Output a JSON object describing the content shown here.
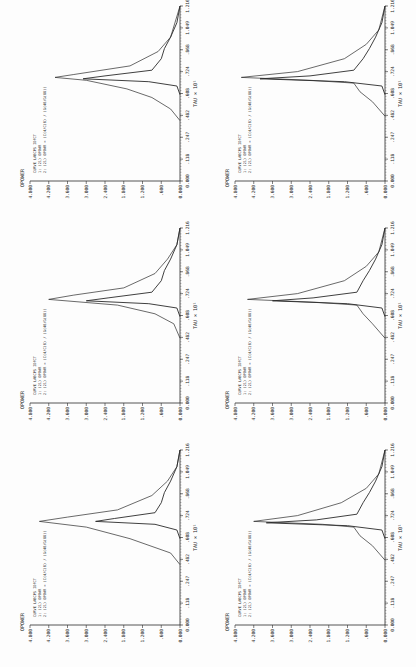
{
  "chart_data": [
    {
      "type": "line",
      "panel": 1,
      "ylabel": "OPOWER",
      "xlabel": "TAU × 10^1",
      "yticks": [
        "0.000",
        ".600",
        "1.200",
        "1.800",
        "2.400",
        "3.000",
        "3.600",
        "4.200",
        "4.800"
      ],
      "xticks": [
        "0.000",
        ".118",
        ".247",
        ".482",
        ".608",
        ".724",
        ".868",
        "1.049",
        "1.216"
      ],
      "ylim": [
        0,
        4.8
      ],
      "xlim": [
        0,
        1.216
      ],
      "legend": {
        "headers": [
          "CURVE",
          "LABCPS",
          "IDFCT"
        ],
        "rows": [
          [
            "1:",
            "(21)",
            "OPOWR"
          ],
          [
            "2:",
            "(21)",
            "OPOWR = (C(4/C(8) / (G(48/G(88))"
          ]
        ]
      },
      "series": [
        {
          "name": "1",
          "x": [
            0.42,
            0.5,
            0.6,
            0.68,
            0.72,
            0.75,
            0.8,
            0.9,
            1.0,
            1.1,
            1.216
          ],
          "y": [
            0.0,
            0.3,
            1.6,
            3.0,
            4.5,
            3.6,
            2.0,
            0.9,
            0.4,
            0.1,
            0.0
          ]
        },
        {
          "name": "2",
          "x": [
            0.6,
            0.66,
            0.7,
            0.72,
            0.74,
            0.78,
            0.85,
            0.92,
            1.0,
            1.1,
            1.216
          ],
          "y": [
            0.0,
            0.1,
            0.8,
            2.7,
            2.1,
            0.8,
            0.6,
            0.5,
            0.3,
            0.1,
            0.0
          ]
        }
      ]
    },
    {
      "type": "line",
      "panel": 2,
      "ylabel": "OPOWER",
      "xlabel": "TAU × 10^1",
      "yticks": [
        "0.000",
        ".600",
        "1.200",
        "1.800",
        "2.400",
        "3.000",
        "3.600",
        "4.200",
        "4.800"
      ],
      "xticks": [
        "0.000",
        ".118",
        ".247",
        ".482",
        ".608",
        ".724",
        ".868",
        "1.049",
        "1.216"
      ],
      "ylim": [
        0,
        4.8
      ],
      "xlim": [
        0,
        1.216
      ],
      "legend": {
        "headers": [
          "CURVE",
          "LABCPS",
          "IDFCT"
        ],
        "rows": [
          [
            "1:",
            "(21)",
            "OPOWR"
          ],
          [
            "2:",
            "(21)",
            "OPOWR = (C(4/C(8) / (G(48/G(88))"
          ]
        ]
      },
      "series": [
        {
          "name": "1",
          "x": [
            0.45,
            0.55,
            0.62,
            0.68,
            0.72,
            0.75,
            0.8,
            0.9,
            1.0,
            1.1,
            1.216
          ],
          "y": [
            0.0,
            0.2,
            0.8,
            2.0,
            4.2,
            3.4,
            1.8,
            0.8,
            0.4,
            0.1,
            0.0
          ]
        },
        {
          "name": "2",
          "x": [
            0.6,
            0.66,
            0.69,
            0.71,
            0.73,
            0.77,
            0.85,
            0.92,
            1.0,
            1.1,
            1.216
          ],
          "y": [
            0.0,
            0.1,
            1.0,
            3.0,
            2.3,
            0.9,
            0.6,
            0.5,
            0.3,
            0.1,
            0.0
          ]
        }
      ]
    },
    {
      "type": "line",
      "panel": 3,
      "ylabel": "OPOWER",
      "xlabel": "TAU × 10^1",
      "yticks": [
        "0.000",
        ".600",
        "1.200",
        "1.800",
        "2.400",
        "3.000",
        "3.600",
        "4.200",
        "4.800"
      ],
      "xticks": [
        "0.000",
        ".118",
        ".247",
        ".482",
        ".608",
        ".724",
        ".868",
        "1.049",
        "1.216"
      ],
      "ylim": [
        0,
        4.8
      ],
      "xlim": [
        0,
        1.216
      ],
      "legend": {
        "headers": [
          "CURVE",
          "LABCPS",
          "IDFCT"
        ],
        "rows": [
          [
            "1:",
            "(21)",
            "OPOWR"
          ],
          [
            "2:",
            "(21)",
            "OPOWR = (C(4/C(8) / (G(48/G(88))"
          ]
        ]
      },
      "series": [
        {
          "name": "1",
          "x": [
            0.42,
            0.5,
            0.58,
            0.64,
            0.7,
            0.72,
            0.74,
            0.8,
            0.9,
            1.0,
            1.216
          ],
          "y": [
            0.0,
            0.3,
            0.9,
            1.7,
            3.0,
            4.0,
            3.4,
            1.6,
            0.7,
            0.3,
            0.0
          ]
        },
        {
          "name": "2",
          "x": [
            0.6,
            0.66,
            0.69,
            0.71,
            0.73,
            0.77,
            0.85,
            0.92,
            1.0,
            1.1,
            1.216
          ],
          "y": [
            0.0,
            0.1,
            1.0,
            3.1,
            2.4,
            0.9,
            0.6,
            0.5,
            0.3,
            0.1,
            0.0
          ]
        }
      ]
    },
    {
      "type": "line",
      "panel": 4,
      "ylabel": "OPOWER",
      "xlabel": "TAU × 10^1",
      "yticks": [
        "0.000",
        ".600",
        "1.200",
        "1.800",
        "2.400",
        "3.000",
        "3.600",
        "4.200",
        "4.800"
      ],
      "xticks": [
        "0.000",
        ".118",
        ".247",
        ".482",
        ".608",
        ".724",
        ".868",
        "1.049",
        "1.216"
      ],
      "ylim": [
        0,
        4.8
      ],
      "xlim": [
        0,
        1.216
      ],
      "legend": {
        "headers": [
          "CURVE",
          "LABCPS",
          "IDFCT"
        ],
        "rows": [
          [
            "1:",
            "(21)",
            "OPOWR"
          ],
          [
            "2:",
            "(21)",
            "OPOWR = (C(4/C(8) / (G(48/G(88))"
          ]
        ]
      },
      "series": [
        {
          "name": "1",
          "x": [
            0.45,
            0.55,
            0.62,
            0.68,
            0.7,
            0.72,
            0.76,
            0.85,
            0.95,
            1.05,
            1.216
          ],
          "y": [
            0.0,
            0.4,
            0.8,
            1.0,
            2.0,
            4.2,
            2.8,
            1.4,
            0.6,
            0.2,
            0.0
          ]
        },
        {
          "name": "2",
          "x": [
            0.6,
            0.66,
            0.69,
            0.71,
            0.73,
            0.77,
            0.85,
            0.92,
            1.0,
            1.1,
            1.216
          ],
          "y": [
            0.0,
            0.1,
            1.2,
            3.8,
            2.2,
            0.9,
            0.7,
            0.5,
            0.3,
            0.1,
            0.0
          ]
        }
      ]
    },
    {
      "type": "line",
      "panel": 5,
      "ylabel": "OPOWER",
      "xlabel": "TAU × 10^1",
      "yticks": [
        "0.000",
        ".600",
        "1.200",
        "1.800",
        "2.400",
        "3.000",
        "3.600",
        "4.200",
        "4.800"
      ],
      "xticks": [
        "0.000",
        ".118",
        ".247",
        ".482",
        ".608",
        ".724",
        ".868",
        "1.049",
        "1.216"
      ],
      "ylim": [
        0,
        4.8
      ],
      "xlim": [
        0,
        1.216
      ],
      "legend": {
        "headers": [
          "CURVE",
          "LABCPS",
          "IDFCT"
        ],
        "rows": [
          [
            "1:",
            "(21)",
            "OPOWR"
          ],
          [
            "2:",
            "(21)",
            "OPOWR = (C(4/C(8) / (G(48/G(88))"
          ]
        ]
      },
      "series": [
        {
          "name": "1",
          "x": [
            0.45,
            0.55,
            0.62,
            0.68,
            0.7,
            0.72,
            0.76,
            0.85,
            0.95,
            1.05,
            1.216
          ],
          "y": [
            0.0,
            0.4,
            0.7,
            0.9,
            2.2,
            4.4,
            2.8,
            1.3,
            0.6,
            0.2,
            0.0
          ]
        },
        {
          "name": "2",
          "x": [
            0.6,
            0.66,
            0.69,
            0.71,
            0.73,
            0.77,
            0.85,
            0.92,
            1.0,
            1.1,
            1.216
          ],
          "y": [
            0.0,
            0.1,
            1.2,
            3.6,
            2.3,
            0.9,
            0.7,
            0.5,
            0.3,
            0.1,
            0.0
          ]
        }
      ]
    },
    {
      "type": "line",
      "panel": 6,
      "ylabel": "OPOWER",
      "xlabel": "TAU × 10^1",
      "yticks": [
        "0.000",
        ".600",
        "1.200",
        "1.800",
        "2.400",
        "3.000",
        "3.600",
        "4.200",
        "4.800"
      ],
      "xticks": [
        "0.000",
        ".118",
        ".247",
        ".482",
        ".608",
        ".724",
        ".868",
        "1.049",
        "1.216"
      ],
      "ylim": [
        0,
        4.8
      ],
      "xlim": [
        0,
        1.216
      ],
      "legend": {
        "headers": [
          "CURVE",
          "LABCPS",
          "IDFCT"
        ],
        "rows": [
          [
            "1:",
            "(21)",
            "OPOWR"
          ],
          [
            "2:",
            "(21)",
            "OPOWR = (C(4/C(8) / (G(48/G(88))"
          ]
        ]
      },
      "series": [
        {
          "name": "1",
          "x": [
            0.45,
            0.55,
            0.62,
            0.68,
            0.7,
            0.72,
            0.76,
            0.85,
            0.95,
            1.05,
            1.216
          ],
          "y": [
            0.0,
            0.4,
            0.8,
            1.0,
            2.4,
            4.6,
            2.8,
            1.3,
            0.6,
            0.2,
            0.0
          ]
        },
        {
          "name": "2",
          "x": [
            0.6,
            0.66,
            0.69,
            0.71,
            0.73,
            0.77,
            0.85,
            0.92,
            1.0,
            1.1,
            1.216
          ],
          "y": [
            0.0,
            0.1,
            1.3,
            4.0,
            2.4,
            1.0,
            0.7,
            0.5,
            0.3,
            0.1,
            0.0
          ]
        }
      ]
    }
  ],
  "labels": {
    "ylabel": "OPOWER",
    "xlabel": "TAU × 10¹",
    "legend_header": "CURVE  LABCPS  IDFCT",
    "legend_row1": "1:     (21)    OPOWR",
    "legend_row2": "2:     (21)    OPOWR = (C(4/C(8) / (G(48/G(88))"
  },
  "colors": {
    "ink": "#2a2a2a",
    "paper": "#fdfdfd"
  }
}
